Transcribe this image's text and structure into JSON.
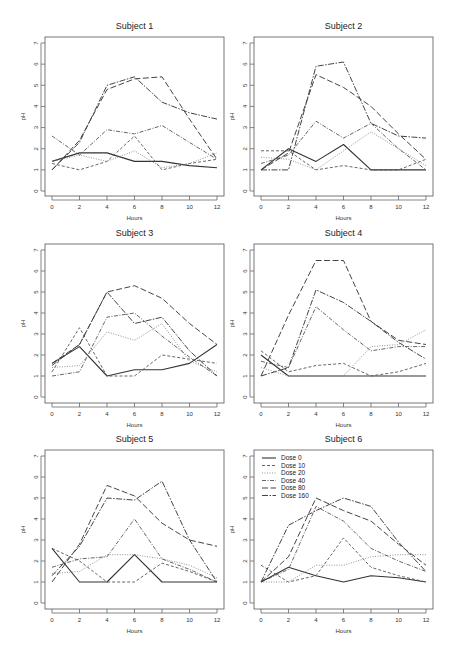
{
  "chart_data": {
    "type": "line",
    "layout": "3x2 small multiples",
    "x": [
      0,
      2,
      4,
      6,
      8,
      10,
      12
    ],
    "xlabel": "Hours",
    "ylabel": "pH",
    "xticks": [
      0,
      2,
      4,
      6,
      8,
      10,
      12
    ],
    "yticks": [
      0,
      1,
      2,
      3,
      4,
      5,
      6,
      7
    ],
    "xlim": [
      0,
      12
    ],
    "ylim": [
      0,
      7
    ],
    "grid": false,
    "legend": {
      "position": "top-left of Subject 6 panel",
      "entries": [
        "Dose 0",
        "Dose 10",
        "Dose 20",
        "Dose 40",
        "Dose 80",
        "Dose 160"
      ]
    },
    "series_styles": {
      "Dose 0": {
        "dash": "",
        "width": 1.1,
        "color": "#333333"
      },
      "Dose 10": {
        "dash": "3,2",
        "width": 0.9,
        "color": "#555555"
      },
      "Dose 20": {
        "dash": "1,1.5",
        "width": 0.9,
        "color": "#888888"
      },
      "Dose 40": {
        "dash": "4,1.5,1,1.5",
        "width": 0.9,
        "color": "#555555"
      },
      "Dose 80": {
        "dash": "6,2.5",
        "width": 1.0,
        "color": "#444444"
      },
      "Dose 160": {
        "dash": "6,1.5,1.5,1.5",
        "width": 1.0,
        "color": "#444444"
      }
    },
    "panels": [
      {
        "title": "Subject 1",
        "series": [
          {
            "name": "Dose 0",
            "values": [
              1.4,
              1.8,
              1.8,
              1.4,
              1.4,
              1.2,
              1.1
            ]
          },
          {
            "name": "Dose 10",
            "values": [
              1.3,
              1.0,
              1.4,
              2.6,
              1.0,
              1.3,
              1.5
            ]
          },
          {
            "name": "Dose 20",
            "values": [
              1.4,
              1.7,
              1.4,
              1.9,
              1.1,
              1.3,
              1.8
            ]
          },
          {
            "name": "Dose 40",
            "values": [
              2.6,
              1.7,
              2.9,
              2.7,
              3.1,
              2.3,
              1.5
            ]
          },
          {
            "name": "Dose 80",
            "values": [
              1.0,
              2.4,
              4.8,
              5.3,
              5.4,
              3.4,
              1.5
            ]
          },
          {
            "name": "Dose 160",
            "values": [
              1.0,
              2.3,
              5.0,
              5.4,
              4.2,
              3.7,
              3.4
            ]
          }
        ]
      },
      {
        "title": "Subject 2",
        "series": [
          {
            "name": "Dose 0",
            "values": [
              1.0,
              2.0,
              1.4,
              2.2,
              1.0,
              1.0,
              1.0
            ]
          },
          {
            "name": "Dose 10",
            "values": [
              1.9,
              1.9,
              1.0,
              1.2,
              1.0,
              1.0,
              1.5
            ]
          },
          {
            "name": "Dose 20",
            "values": [
              1.6,
              1.5,
              1.0,
              1.9,
              2.8,
              2.0,
              1.2
            ]
          },
          {
            "name": "Dose 40",
            "values": [
              1.3,
              1.7,
              3.3,
              2.5,
              3.2,
              2.0,
              1.0
            ]
          },
          {
            "name": "Dose 80",
            "values": [
              1.0,
              1.8,
              5.5,
              4.9,
              4.0,
              2.7,
              1.5
            ]
          },
          {
            "name": "Dose 160",
            "values": [
              1.0,
              1.0,
              5.9,
              6.1,
              3.2,
              2.6,
              2.5
            ]
          }
        ]
      },
      {
        "title": "Subject 3",
        "series": [
          {
            "name": "Dose 0",
            "values": [
              1.6,
              2.4,
              1.0,
              1.3,
              1.3,
              1.6,
              2.5
            ]
          },
          {
            "name": "Dose 10",
            "values": [
              1.2,
              3.3,
              1.0,
              1.0,
              2.0,
              1.8,
              1.6
            ]
          },
          {
            "name": "Dose 20",
            "values": [
              1.4,
              1.5,
              3.1,
              2.7,
              3.5,
              1.7,
              1.2
            ]
          },
          {
            "name": "Dose 40",
            "values": [
              1.0,
              1.2,
              3.8,
              4.0,
              2.9,
              1.9,
              1.0
            ]
          },
          {
            "name": "Dose 80",
            "values": [
              1.6,
              2.5,
              5.0,
              5.3,
              4.7,
              3.5,
              2.5
            ]
          },
          {
            "name": "Dose 160",
            "values": [
              1.5,
              2.5,
              5.0,
              3.5,
              3.8,
              2.2,
              1.0
            ]
          }
        ]
      },
      {
        "title": "Subject 4",
        "series": [
          {
            "name": "Dose 0",
            "values": [
              2.0,
              1.0,
              1.0,
              1.0,
              1.0,
              1.0,
              1.0
            ]
          },
          {
            "name": "Dose 10",
            "values": [
              2.2,
              1.2,
              1.5,
              1.6,
              1.0,
              1.2,
              1.6
            ]
          },
          {
            "name": "Dose 20",
            "values": [
              1.4,
              1.0,
              1.0,
              1.0,
              2.4,
              2.5,
              3.2
            ]
          },
          {
            "name": "Dose 40",
            "values": [
              1.7,
              1.4,
              4.3,
              3.2,
              2.2,
              2.4,
              2.4
            ]
          },
          {
            "name": "Dose 80",
            "values": [
              1.0,
              3.9,
              6.5,
              6.5,
              3.6,
              2.7,
              2.5
            ]
          },
          {
            "name": "Dose 160",
            "values": [
              1.0,
              1.4,
              5.1,
              4.5,
              3.6,
              2.6,
              1.8
            ]
          }
        ]
      },
      {
        "title": "Subject 5",
        "series": [
          {
            "name": "Dose 0",
            "values": [
              2.6,
              1.0,
              1.0,
              2.3,
              1.0,
              1.0,
              1.0
            ]
          },
          {
            "name": "Dose 10",
            "values": [
              2.6,
              2.0,
              1.0,
              1.0,
              1.9,
              1.5,
              1.0
            ]
          },
          {
            "name": "Dose 20",
            "values": [
              1.4,
              1.5,
              2.3,
              2.3,
              2.1,
              1.8,
              1.2
            ]
          },
          {
            "name": "Dose 40",
            "values": [
              1.7,
              2.1,
              2.2,
              4.0,
              2.1,
              1.6,
              1.0
            ]
          },
          {
            "name": "Dose 80",
            "values": [
              1.0,
              2.8,
              5.6,
              5.1,
              3.8,
              3.0,
              2.7
            ]
          },
          {
            "name": "Dose 160",
            "values": [
              1.3,
              2.7,
              5.0,
              4.9,
              5.8,
              3.0,
              1.0
            ]
          }
        ]
      },
      {
        "title": "Subject 6",
        "series": [
          {
            "name": "Dose 0",
            "values": [
              1.0,
              1.7,
              1.3,
              1.0,
              1.3,
              1.2,
              1.0
            ]
          },
          {
            "name": "Dose 10",
            "values": [
              1.8,
              1.0,
              1.3,
              3.1,
              1.7,
              1.3,
              1.0
            ]
          },
          {
            "name": "Dose 20",
            "values": [
              1.0,
              1.0,
              1.8,
              1.8,
              2.2,
              2.3,
              2.3
            ]
          },
          {
            "name": "Dose 40",
            "values": [
              1.0,
              1.6,
              4.6,
              3.9,
              2.6,
              2.0,
              1.5
            ]
          },
          {
            "name": "Dose 80",
            "values": [
              1.0,
              2.2,
              5.0,
              4.4,
              3.9,
              2.8,
              1.8
            ]
          },
          {
            "name": "Dose 160",
            "values": [
              1.0,
              3.7,
              4.4,
              5.0,
              4.6,
              2.9,
              1.5
            ]
          }
        ]
      }
    ]
  }
}
